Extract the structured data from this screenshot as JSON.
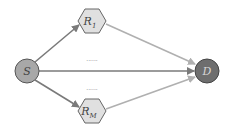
{
  "diagram": {
    "type": "relay-network",
    "nodes": [
      {
        "id": "S",
        "label": "S",
        "shape": "circle",
        "fill": "#a8a8a8"
      },
      {
        "id": "R1",
        "label": "R",
        "sub": "1",
        "shape": "hexagon",
        "fill": "#e0e0e0"
      },
      {
        "id": "RM",
        "label": "R",
        "sub": "M",
        "shape": "hexagon",
        "fill": "#e0e0e0"
      },
      {
        "id": "D",
        "label": "D",
        "shape": "circle",
        "fill": "#6e6e6e"
      }
    ],
    "edges": [
      {
        "from": "S",
        "to": "R1",
        "color": "#7a7a7a"
      },
      {
        "from": "S",
        "to": "RM",
        "color": "#7a7a7a"
      },
      {
        "from": "S",
        "to": "D",
        "color": "#7a7a7a"
      },
      {
        "from": "R1",
        "to": "D",
        "color": "#b0b0b0"
      },
      {
        "from": "RM",
        "to": "D",
        "color": "#b0b0b0"
      }
    ],
    "ellipsis_top": "......",
    "ellipsis_bottom": "......"
  }
}
